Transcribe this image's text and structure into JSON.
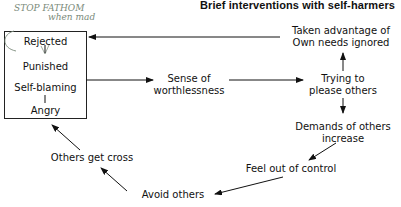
{
  "header": {
    "title": "Brief interventions with self-harmers"
  },
  "handwritten_note": {
    "line1": "STOP FATHOM",
    "line2": "when mad"
  },
  "box": {
    "items": [
      "Rejected",
      "Punished",
      "Self-blaming",
      "Angry"
    ]
  },
  "nodes": {
    "sense": {
      "line1": "Sense of",
      "line2": "worthlessness"
    },
    "taken": {
      "line1": "Taken advantage of",
      "line2": "Own needs ignored"
    },
    "trying": {
      "line1": "Trying to",
      "line2": "please others"
    },
    "demands": {
      "line1": "Demands of others",
      "line2": "increase"
    },
    "feel": {
      "line1": "Feel out of control"
    },
    "avoid": {
      "line1": "Avoid others"
    },
    "cross": {
      "line1": "Others get cross"
    }
  },
  "colors": {
    "ink": "#111111",
    "handwriting": "#7a8a7a"
  }
}
